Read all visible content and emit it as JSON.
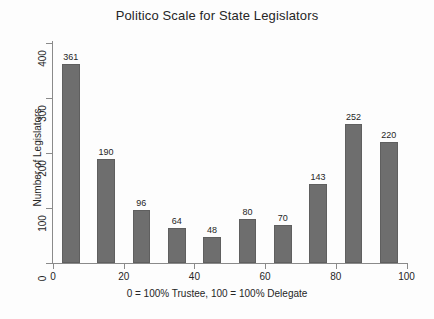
{
  "chart_data": {
    "type": "bar",
    "title": "Politico Scale for State Legislators",
    "xlabel": "0 = 100% Trustee, 100 = 100% Delegate",
    "ylabel": "Number of Legislators",
    "categories": [
      "5",
      "15",
      "25",
      "35",
      "45",
      "55",
      "65",
      "75",
      "85",
      "95"
    ],
    "x": [
      5,
      15,
      25,
      35,
      45,
      55,
      65,
      75,
      85,
      95
    ],
    "values": [
      361,
      190,
      96,
      64,
      48,
      80,
      70,
      143,
      252,
      220
    ],
    "bar_labels": [
      "361",
      "190",
      "96",
      "64",
      "48",
      "80",
      "70",
      "143",
      "252",
      "220"
    ],
    "bin_width": 10,
    "xlim": [
      0,
      100
    ],
    "ylim": [
      0,
      400
    ],
    "xticks": [
      0,
      20,
      40,
      60,
      80,
      100
    ],
    "xtick_labels": [
      "0",
      "20",
      "40",
      "60",
      "80",
      "100"
    ],
    "yticks": [
      0,
      100,
      200,
      300,
      400
    ],
    "ytick_labels": [
      "0",
      "100",
      "200",
      "300",
      "400"
    ],
    "grid": false,
    "legend": null,
    "bar_color": "#6e6e6e",
    "bar_edge_color": "#5f5f5f",
    "background_color": "#fdfdfd",
    "axis_color": "#8a8a8a",
    "text_color": "#262626"
  }
}
